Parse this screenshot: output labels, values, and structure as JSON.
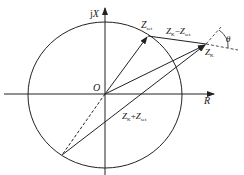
{
  "diagram": {
    "type": "impedance-circle",
    "axes": {
      "x_label": "R",
      "y_label_prefix": "j",
      "y_label": "X",
      "origin_label": "O"
    },
    "labels": {
      "z_set": {
        "main": "Z",
        "sub": "set"
      },
      "z_k": {
        "main": "Z",
        "sub": "K"
      },
      "z_diff": {
        "main1": "Z",
        "sub1": "K",
        "op": "−",
        "main2": "Z",
        "sub2": "set"
      },
      "z_sum": {
        "main1": "Z",
        "sub1": "K",
        "op": "+",
        "main2": "Z",
        "sub2": "set"
      },
      "angle": "θ"
    },
    "colors": {
      "stroke": "#222222",
      "background": "#ffffff"
    }
  }
}
